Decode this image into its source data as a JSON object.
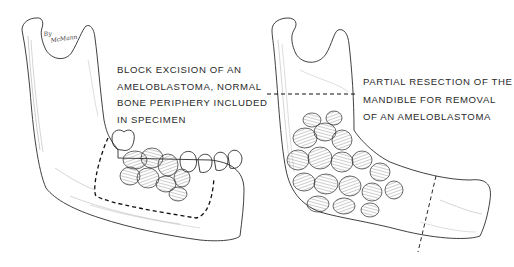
{
  "figure": {
    "left_panel": {
      "caption_lines": [
        "BLOCK EXCISION OF AN",
        "AMELOBLASTOMA, NORMAL",
        "BONE PERIPHERY INCLUDED",
        "IN  SPECIMEN"
      ],
      "signature_lines": [
        "By",
        "McMann"
      ],
      "illustration": "mandible-block-excision"
    },
    "right_panel": {
      "caption_lines": [
        "PARTIAL RESECTION OF THE",
        "MANDIBLE FOR REMOVAL",
        "OF AN AMELOBLASTOMA"
      ],
      "illustration": "mandible-partial-resection"
    },
    "colors": {
      "line": "#2b2b2b",
      "hatch": "#8a8a8a",
      "background": "#ffffff"
    }
  }
}
